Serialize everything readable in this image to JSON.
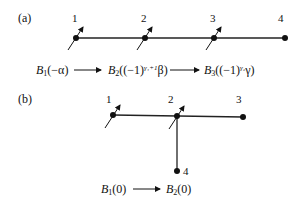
{
  "panels": [
    {
      "label": "(a)",
      "nodes": [
        {
          "id": "1",
          "label": "1",
          "spin": true
        },
        {
          "id": "2",
          "label": "2",
          "spin": true
        },
        {
          "id": "3",
          "label": "3",
          "spin": true
        },
        {
          "id": "4",
          "label": "4",
          "spin": false
        }
      ],
      "edges": [
        [
          "1",
          "2"
        ],
        [
          "2",
          "3"
        ],
        [
          "3",
          "4"
        ]
      ],
      "sequence": [
        {
          "base": "B",
          "sub": "1",
          "arg_pre": "(−α)",
          "sup": "",
          "arg_post": ""
        },
        {
          "base": "B",
          "sub": "2",
          "arg_pre": "((−1)",
          "sup": "γ₁+1",
          "arg_post": "β)"
        },
        {
          "base": "B",
          "sub": "3",
          "arg_pre": "((−1)",
          "sup": "γ₂",
          "arg_post": "γ)"
        }
      ]
    },
    {
      "label": "(b)",
      "nodes": [
        {
          "id": "1",
          "label": "1",
          "spin": true
        },
        {
          "id": "2",
          "label": "2",
          "spin": true
        },
        {
          "id": "3",
          "label": "3",
          "spin": false
        },
        {
          "id": "4",
          "label": "4",
          "spin": false
        }
      ],
      "edges": [
        [
          "1",
          "2"
        ],
        [
          "2",
          "3"
        ],
        [
          "2",
          "4"
        ]
      ],
      "sequence": [
        {
          "base": "B",
          "sub": "1",
          "arg_pre": "(0)",
          "sup": "",
          "arg_post": ""
        },
        {
          "base": "B",
          "sub": "2",
          "arg_pre": "(0)",
          "sup": "",
          "arg_post": ""
        }
      ]
    }
  ]
}
